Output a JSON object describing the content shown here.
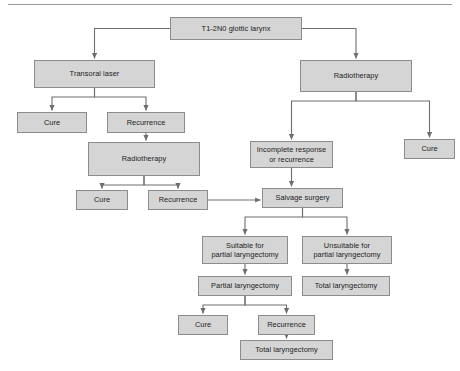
{
  "diagram": {
    "title_rule": "horizontal-rule",
    "nodes": [
      {
        "id": "root",
        "label": "T1-2N0 glottic larynx",
        "x": 170,
        "y": 17,
        "w": 132,
        "h": 23
      },
      {
        "id": "transoral_laser",
        "label": "Transoral laser",
        "x": 34,
        "y": 60,
        "w": 121,
        "h": 28
      },
      {
        "id": "rt_right",
        "label": "Radiotherapy",
        "x": 300,
        "y": 60,
        "w": 112,
        "h": 32
      },
      {
        "id": "cure_l1",
        "label": "Cure",
        "x": 17,
        "y": 112,
        "w": 70,
        "h": 21
      },
      {
        "id": "recurrence_l1",
        "label": "Recurrence",
        "x": 107,
        "y": 112,
        "w": 78,
        "h": 21
      },
      {
        "id": "incomplete_response",
        "label": "Incomplete response\nor recurrence",
        "x": 250,
        "y": 141,
        "w": 83,
        "h": 27
      },
      {
        "id": "cure_r1",
        "label": "Cure",
        "x": 404,
        "y": 139,
        "w": 51,
        "h": 20
      },
      {
        "id": "rt_left",
        "label": "Radiotherapy",
        "x": 88,
        "y": 142,
        "w": 112,
        "h": 34
      },
      {
        "id": "cure_l2",
        "label": "Cure",
        "x": 76,
        "y": 190,
        "w": 52,
        "h": 20
      },
      {
        "id": "recurrence_l2",
        "label": "Recurrence",
        "x": 148,
        "y": 190,
        "w": 60,
        "h": 20
      },
      {
        "id": "salvage_surgery",
        "label": "Salvage surgery",
        "x": 262,
        "y": 188,
        "w": 81,
        "h": 20
      },
      {
        "id": "suitable_partial",
        "label": "Suitable for\npartial laryngectomy",
        "x": 202,
        "y": 236,
        "w": 86,
        "h": 28
      },
      {
        "id": "unsuitable_partial",
        "label": "Unsuitable for\npartial laryngectomy",
        "x": 302,
        "y": 236,
        "w": 90,
        "h": 28
      },
      {
        "id": "partial_laryngectomy",
        "label": "Partial laryngectomy",
        "x": 198,
        "y": 276,
        "w": 94,
        "h": 20
      },
      {
        "id": "total_laryngectomy_1",
        "label": "Total laryngectomy",
        "x": 302,
        "y": 276,
        "w": 88,
        "h": 20
      },
      {
        "id": "cure_b",
        "label": "Cure",
        "x": 178,
        "y": 315,
        "w": 50,
        "h": 20
      },
      {
        "id": "recurrence_b",
        "label": "Recurrence",
        "x": 258,
        "y": 315,
        "w": 57,
        "h": 20
      },
      {
        "id": "total_laryngectomy_2",
        "label": "Total laryngectomy",
        "x": 240,
        "y": 340,
        "w": 93,
        "h": 20
      }
    ],
    "edges": [
      {
        "from": "root",
        "to": "transoral_laser",
        "kind": "split-left"
      },
      {
        "from": "root",
        "to": "rt_right",
        "kind": "split-right"
      },
      {
        "from": "transoral_laser",
        "to": "cure_l1",
        "kind": "split-left"
      },
      {
        "from": "transoral_laser",
        "to": "recurrence_l1",
        "kind": "split-right"
      },
      {
        "from": "recurrence_l1",
        "to": "rt_left",
        "kind": "vertical"
      },
      {
        "from": "rt_left",
        "to": "cure_l2",
        "kind": "split-left"
      },
      {
        "from": "rt_left",
        "to": "recurrence_l2",
        "kind": "split-right"
      },
      {
        "from": "recurrence_l2",
        "to": "salvage_surgery",
        "kind": "horizontal"
      },
      {
        "from": "rt_right",
        "to": "incomplete_response",
        "kind": "split-left"
      },
      {
        "from": "rt_right",
        "to": "cure_r1",
        "kind": "split-right"
      },
      {
        "from": "incomplete_response",
        "to": "salvage_surgery",
        "kind": "vertical"
      },
      {
        "from": "salvage_surgery",
        "to": "suitable_partial",
        "kind": "split-left"
      },
      {
        "from": "salvage_surgery",
        "to": "unsuitable_partial",
        "kind": "split-right"
      },
      {
        "from": "suitable_partial",
        "to": "partial_laryngectomy",
        "kind": "vertical"
      },
      {
        "from": "unsuitable_partial",
        "to": "total_laryngectomy_1",
        "kind": "vertical"
      },
      {
        "from": "partial_laryngectomy",
        "to": "cure_b",
        "kind": "split-left"
      },
      {
        "from": "partial_laryngectomy",
        "to": "recurrence_b",
        "kind": "split-right"
      },
      {
        "from": "recurrence_b",
        "to": "total_laryngectomy_2",
        "kind": "vertical"
      }
    ],
    "colors": {
      "node_fill": "#d5d5d5",
      "node_border": "#8c8c8c",
      "connector": "#6e6e6e",
      "text": "#1c1c1c",
      "rule": "#9a9a9a",
      "background": "#ffffff"
    }
  }
}
